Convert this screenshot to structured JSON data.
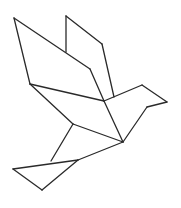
{
  "figure": {
    "title": "Tangram bird (dove) line drawing",
    "width": 181,
    "height": 208,
    "background": "#ffffff",
    "stroke_color": "#2a2a2a",
    "stroke_width": 1.3
  },
  "shapes": [
    {
      "name": "left-wing",
      "points": "14,18 90,69 104,101 30,84"
    },
    {
      "name": "right-wing-upper",
      "points": "66,16 102,44 114,97"
    },
    {
      "name": "right-wing-lower",
      "points": "66,52 90,69 104,101 114,97 102,44 66,16"
    },
    {
      "name": "body-upper",
      "points": "30,84 104,101 123,142 73,124"
    },
    {
      "name": "head",
      "points": "104,101 114,97 142,85 167,102 147,107 123,142"
    },
    {
      "name": "body-lower",
      "points": "73,124 123,142 78,160 51,161"
    },
    {
      "name": "tail",
      "points": "13,169 51,161 78,160 42,190"
    }
  ],
  "lines": [
    {
      "name": "left-wing-left-edge",
      "x1": 14,
      "y1": 18,
      "x2": 30,
      "y2": 84
    },
    {
      "name": "left-wing-diagonal",
      "x1": 14,
      "y1": 18,
      "x2": 90,
      "y2": 69
    },
    {
      "name": "wing-fold-edge",
      "x1": 90,
      "y1": 69,
      "x2": 104,
      "y2": 101
    },
    {
      "name": "wing-base",
      "x1": 30,
      "y1": 84,
      "x2": 104,
      "y2": 101
    },
    {
      "name": "right-wing-left-edge",
      "x1": 66,
      "y1": 16,
      "x2": 66,
      "y2": 52
    },
    {
      "name": "right-wing-top-edge",
      "x1": 66,
      "y1": 16,
      "x2": 102,
      "y2": 44
    },
    {
      "name": "right-wing-right-edge",
      "x1": 102,
      "y1": 44,
      "x2": 114,
      "y2": 97
    },
    {
      "name": "neck-top",
      "x1": 104,
      "y1": 101,
      "x2": 142,
      "y2": 85
    },
    {
      "name": "head-top",
      "x1": 142,
      "y1": 85,
      "x2": 167,
      "y2": 102
    },
    {
      "name": "beak-bottom",
      "x1": 167,
      "y1": 102,
      "x2": 147,
      "y2": 107
    },
    {
      "name": "throat",
      "x1": 147,
      "y1": 107,
      "x2": 123,
      "y2": 142
    },
    {
      "name": "body-center-line",
      "x1": 104,
      "y1": 101,
      "x2": 123,
      "y2": 142
    },
    {
      "name": "back-lower",
      "x1": 30,
      "y1": 84,
      "x2": 73,
      "y2": 124
    },
    {
      "name": "belly-diagonal",
      "x1": 73,
      "y1": 124,
      "x2": 123,
      "y2": 142
    },
    {
      "name": "body-left-lower",
      "x1": 73,
      "y1": 124,
      "x2": 51,
      "y2": 161
    },
    {
      "name": "belly-bottom",
      "x1": 123,
      "y1": 142,
      "x2": 78,
      "y2": 160
    },
    {
      "name": "tail-top",
      "x1": 13,
      "y1": 169,
      "x2": 78,
      "y2": 160
    },
    {
      "name": "tail-left-bottom",
      "x1": 13,
      "y1": 169,
      "x2": 42,
      "y2": 190
    },
    {
      "name": "tail-right-bottom",
      "x1": 42,
      "y1": 190,
      "x2": 78,
      "y2": 160
    }
  ]
}
